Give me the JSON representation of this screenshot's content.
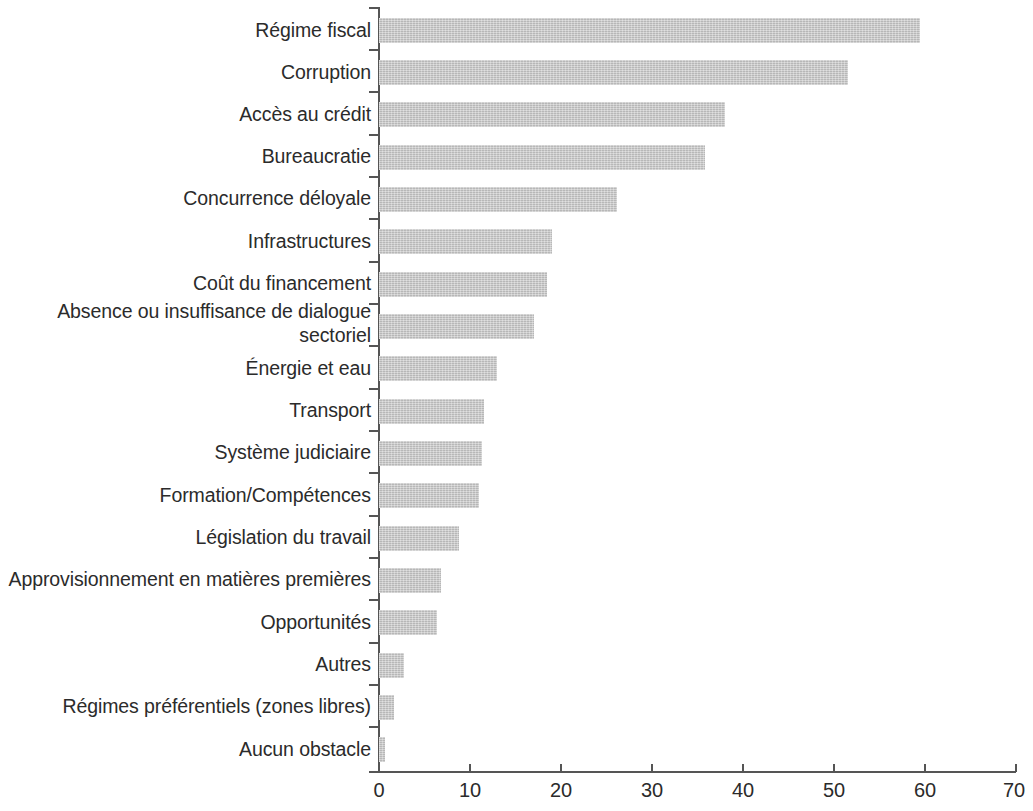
{
  "chart_data": {
    "type": "bar",
    "orientation": "horizontal",
    "title": "",
    "subtitle": "",
    "xlabel": "",
    "ylabel": "",
    "xlim": [
      0,
      70
    ],
    "xticks": [
      "0",
      "10",
      "20",
      "30",
      "40",
      "50",
      "60",
      "70"
    ],
    "grid": false,
    "legend": null,
    "bar_color": "#c6c6c6",
    "axis_color": "#555555",
    "text_color": "#2b2b2b",
    "categories": [
      "Régime fiscal",
      "Corruption",
      "Accès au crédit",
      "Bureaucratie",
      "Concurrence déloyale",
      "Infrastructures",
      "Coût du financement",
      "Absence ou insuffisance de dialogue sectoriel",
      "Énergie et eau",
      "Transport",
      "Système judiciaire",
      "Formation/Compétences",
      "Législation du travail",
      "Approvisionnement en matières premières",
      "Opportunités",
      "Autres",
      "Régimes préférentiels (zones libres)",
      "Aucun obstacle"
    ],
    "values": [
      59.5,
      51.5,
      38.0,
      35.8,
      26.2,
      19.0,
      18.5,
      17.0,
      13.0,
      11.5,
      11.3,
      11.0,
      8.8,
      6.8,
      6.4,
      2.8,
      1.6,
      0.7
    ]
  }
}
